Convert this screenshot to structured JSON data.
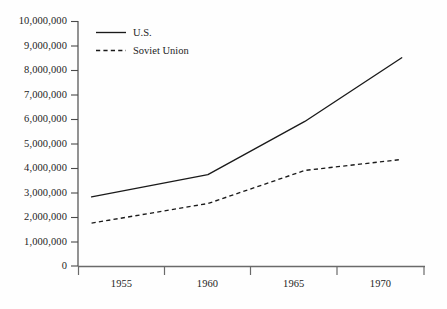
{
  "chart_data": {
    "type": "line",
    "title": "",
    "subtitle": "",
    "xlabel": "",
    "ylabel": "",
    "x": [
      1954,
      1960,
      1965,
      1970
    ],
    "xtick_labels": [
      "1955",
      "1960",
      "1965",
      "1970"
    ],
    "ytick_labels": [
      "0",
      "1,000,000",
      "2,000,000",
      "3,000,000",
      "4,000,000",
      "5,000,000",
      "6,000,000",
      "7,000,000",
      "8,000,000",
      "9,000,000",
      "10,000,000"
    ],
    "ytick_values": [
      0,
      1000000,
      2000000,
      3000000,
      4000000,
      5000000,
      6000000,
      7000000,
      8000000,
      9000000,
      10000000
    ],
    "ylim": [
      0,
      10000000
    ],
    "xlim": [
      1953.3,
      1971.2
    ],
    "grid": false,
    "legend_position": "upper-left-inside",
    "series": [
      {
        "name": "U.S.",
        "style": "solid",
        "color": "#1a1a1a",
        "values": [
          2820000,
          3730000,
          5900000,
          8500000
        ]
      },
      {
        "name": "Soviet Union",
        "style": "dashed",
        "color": "#1a1a1a",
        "values": [
          1750000,
          2550000,
          3900000,
          4350000
        ]
      }
    ]
  },
  "legend": {
    "entries": [
      {
        "label": "U.S.",
        "style": "solid"
      },
      {
        "label": "Soviet Union",
        "style": "dashed"
      }
    ]
  },
  "axes": {
    "y_axis_name": "y-axis",
    "x_axis_name": "x-axis"
  },
  "artifacts": {
    "ghost_line_1": "",
    "ghost_line_2": ""
  }
}
